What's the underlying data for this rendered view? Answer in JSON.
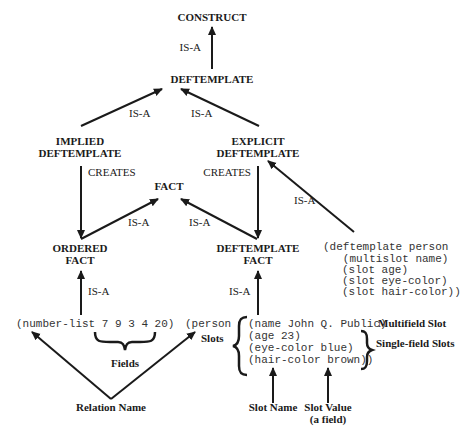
{
  "nodes": {
    "construct": "CONSTRUCT",
    "deftemplate": "DEFTEMPLATE",
    "implied_1": "IMPLIED",
    "implied_2": "DEFTEMPLATE",
    "explicit_1": "EXPLICIT",
    "explicit_2": "DEFTEMPLATE",
    "fact": "FACT",
    "ordered_1": "ORDERED",
    "ordered_2": "FACT",
    "deftemplate_fact_1": "DEFTEMPLATE",
    "deftemplate_fact_2": "FACT"
  },
  "edges": {
    "isa_deftemplate_construct": "IS-A",
    "isa_implied_deftemplate": "IS-A",
    "isa_explicit_deftemplate": "IS-A",
    "creates_implied": "CREATES",
    "creates_explicit": "CREATES",
    "isa_ordered_fact": "IS-A",
    "isa_deftemplatefact_fact": "IS-A",
    "isa_code_explicit": "IS-A",
    "isa_example_ordered": "IS-A",
    "isa_example_deftemplatefact": "IS-A"
  },
  "code": {
    "deftemplate": [
      "(deftemplate person",
      "   (multislot name)",
      "   (slot age)",
      "   (slot eye-color)",
      "   (slot hair-color))"
    ],
    "ordered_fact": "(number-list 7 9 3 4 20)",
    "person_head": "(person",
    "person_slots": [
      "(name John Q. Public)",
      "(age 23)",
      "(eye-color blue)",
      "(hair-color brown))"
    ]
  },
  "annotations": {
    "fields": "Fields",
    "slots": "Slots",
    "multifield_slot": "Multifield Slot",
    "single_field_slots": "Single-field Slots",
    "relation_name": "Relation Name",
    "slot_name": "Slot Name",
    "slot_value_1": "Slot Value",
    "slot_value_2": "(a field)"
  }
}
